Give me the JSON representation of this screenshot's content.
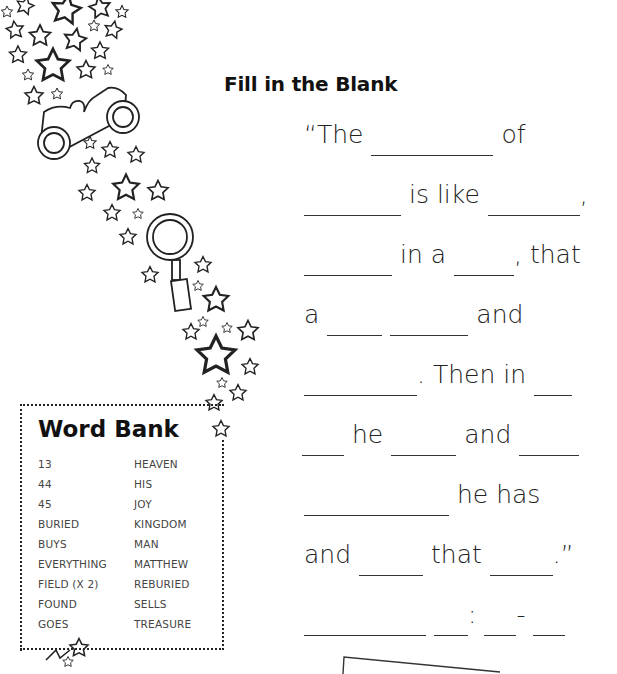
{
  "worksheet": {
    "title": "Fill in the Blank",
    "lines": [
      {
        "parts": [
          {
            "t": "text",
            "v": "“The"
          },
          {
            "t": "blank",
            "w": 122
          },
          {
            "t": "text",
            "v": "of"
          }
        ]
      },
      {
        "parts": [
          {
            "t": "blank",
            "w": 97
          },
          {
            "t": "text",
            "v": "is like"
          },
          {
            "t": "blank",
            "w": 92
          },
          {
            "t": "text",
            "v": ","
          }
        ]
      },
      {
        "parts": [
          {
            "t": "blank",
            "w": 88
          },
          {
            "t": "text",
            "v": "in a"
          },
          {
            "t": "blank",
            "w": 60
          },
          {
            "t": "text",
            "v": ", that"
          }
        ]
      },
      {
        "parts": [
          {
            "t": "text",
            "v": "a"
          },
          {
            "t": "blank",
            "w": 55
          },
          {
            "t": "blank",
            "w": 78
          },
          {
            "t": "text",
            "v": "and"
          }
        ]
      },
      {
        "parts": [
          {
            "t": "blank",
            "w": 113
          },
          {
            "t": "text",
            "v": ". Then in"
          },
          {
            "t": "blank",
            "w": 38
          }
        ]
      },
      {
        "parts": [
          {
            "t": "blank",
            "w": 42
          },
          {
            "t": "text",
            "v": "he"
          },
          {
            "t": "blank",
            "w": 65
          },
          {
            "t": "text",
            "v": "and"
          },
          {
            "t": "blank",
            "w": 60
          }
        ]
      },
      {
        "parts": [
          {
            "t": "blank",
            "w": 145
          },
          {
            "t": "text",
            "v": "he has"
          }
        ]
      },
      {
        "parts": [
          {
            "t": "text",
            "v": "and"
          },
          {
            "t": "blank",
            "w": 64
          },
          {
            "t": "text",
            "v": "that"
          },
          {
            "t": "blank",
            "w": 63
          },
          {
            "t": "text",
            "v": ".”"
          }
        ]
      },
      {
        "parts": [
          {
            "t": "blank",
            "w": 122
          },
          {
            "t": "blank",
            "w": 34
          },
          {
            "t": "text",
            "v": ":"
          },
          {
            "t": "blank",
            "w": 32
          },
          {
            "t": "text",
            "v": "-"
          },
          {
            "t": "blank",
            "w": 32
          }
        ]
      }
    ]
  },
  "word_bank": {
    "title": "Word Bank",
    "column_1": [
      "13",
      "44",
      "45",
      "BURIED",
      "BUYS",
      "EVERYTHING",
      "FIELD (X 2)",
      "FOUND",
      "GOES"
    ],
    "column_2": [
      "HEAVEN",
      "HIS",
      "JOY",
      "KINGDOM",
      "MAN",
      "MATTHEW",
      "REBURIED",
      "SELLS",
      "TREASURE"
    ]
  },
  "decorations": {
    "icons": [
      "star-trail-icon",
      "binoculars-icon",
      "magnifying-glass-icon"
    ]
  }
}
